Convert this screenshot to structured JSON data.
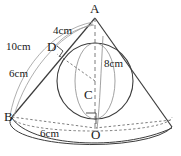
{
  "figure": {
    "stroke_color": "#3c3c3c",
    "dash_color": "#6e6e6e",
    "background": "#ffffff"
  },
  "points": [
    {
      "id": "A",
      "label": "A",
      "x": 95,
      "y": 14,
      "role": "cone-apex"
    },
    {
      "id": "B",
      "label": "B",
      "x": 12,
      "y": 117,
      "role": "base-rim-point"
    },
    {
      "id": "C",
      "label": "C",
      "x": 88,
      "y": 96,
      "role": "sphere-center"
    },
    {
      "id": "D",
      "label": "D",
      "x": 51,
      "y": 47,
      "role": "tangent-point"
    },
    {
      "id": "O",
      "label": "O",
      "x": 92,
      "y": 129,
      "role": "base-center"
    }
  ],
  "dimensions": [
    {
      "id": "AD",
      "label": "4cm",
      "value": 4,
      "unit": "cm",
      "x": 54,
      "y": 30,
      "measures": "A to D"
    },
    {
      "id": "AB",
      "label": "10cm",
      "value": 10,
      "unit": "cm",
      "x": 8,
      "y": 44,
      "measures": "slant height A to B"
    },
    {
      "id": "DB",
      "label": "6cm",
      "value": 6,
      "unit": "cm",
      "x": 12,
      "y": 72,
      "measures": "D to B"
    },
    {
      "id": "AO",
      "label": "8cm",
      "value": 8,
      "unit": "cm",
      "x": 99,
      "y": 62,
      "measures": "cone height A to O"
    },
    {
      "id": "BO",
      "label": "6cm",
      "value": 6,
      "unit": "cm",
      "x": 44,
      "y": 132,
      "measures": "base radius B to O"
    }
  ],
  "right_angles": [
    {
      "id": "angle-at-D",
      "vertex": "D",
      "note": "CD perpendicular to AB"
    },
    {
      "id": "angle-at-O",
      "vertex": "O",
      "note": "AO perpendicular to BO"
    }
  ],
  "shapes": {
    "cone": "apex A with elliptical base centred at O",
    "sphere": "inscribed sphere centred at C, tangent to slant at D and base at O"
  }
}
